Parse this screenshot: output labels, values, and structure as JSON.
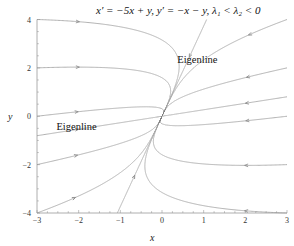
{
  "chart_data": {
    "type": "line",
    "title": "x′ = −5x + y,   y′ = −x − y,      λ₁ < λ₂ < 0",
    "xlabel": "x",
    "ylabel": "y",
    "xlim": [
      -3,
      3
    ],
    "ylim": [
      -4,
      4
    ],
    "xticks": [
      -3,
      -2,
      -1,
      0,
      1,
      2,
      3
    ],
    "yticks": [
      -4,
      -2,
      0,
      2,
      4
    ],
    "xtick_labels": [
      "−3",
      "−2",
      "−1",
      "0",
      "1",
      "2",
      "3"
    ],
    "ytick_labels": [
      "−4",
      "−2",
      "0",
      "2",
      "4"
    ],
    "grid": false,
    "system": {
      "dx": [
        -5,
        1
      ],
      "dy": [
        -1,
        -1
      ]
    },
    "eigenvalues": [
      -4.732,
      -1.268
    ],
    "trajectory_starts": [
      [
        -3,
        4
      ],
      [
        -3,
        2
      ],
      [
        -3,
        0
      ],
      [
        -3,
        -2
      ],
      [
        -3,
        -4
      ],
      [
        -3,
        -0.804
      ],
      [
        3,
        -4
      ],
      [
        3,
        -2
      ],
      [
        3,
        0
      ],
      [
        3,
        2
      ],
      [
        3,
        4
      ],
      [
        3,
        0.804
      ],
      [
        1.072,
        4
      ],
      [
        -1.072,
        -4
      ]
    ],
    "annotations": [
      {
        "text": "Eigenline",
        "x": 0.85,
        "y": 2.2
      },
      {
        "text": "Eigenline",
        "x": -2.05,
        "y": -0.55
      }
    ],
    "curve_color": "#a8a8a8"
  }
}
